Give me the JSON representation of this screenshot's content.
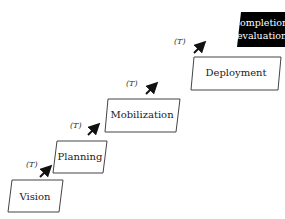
{
  "diagram": {
    "type": "staircase-process",
    "steps": [
      {
        "label": "Vision",
        "style": "outline"
      },
      {
        "label": "Planning",
        "style": "outline"
      },
      {
        "label": "Mobilization",
        "style": "outline"
      },
      {
        "label": "Deployment",
        "style": "outline"
      },
      {
        "label_line1": "Completion/",
        "label_line2": "evaluation",
        "style": "filled"
      }
    ],
    "transitions": [
      {
        "label": "(T)"
      },
      {
        "label": "(T)"
      },
      {
        "label": "(T)"
      },
      {
        "label": "(T)"
      }
    ],
    "colors": {
      "stroke": "#333333",
      "filled": "#000000",
      "background": "#ffffff"
    }
  }
}
